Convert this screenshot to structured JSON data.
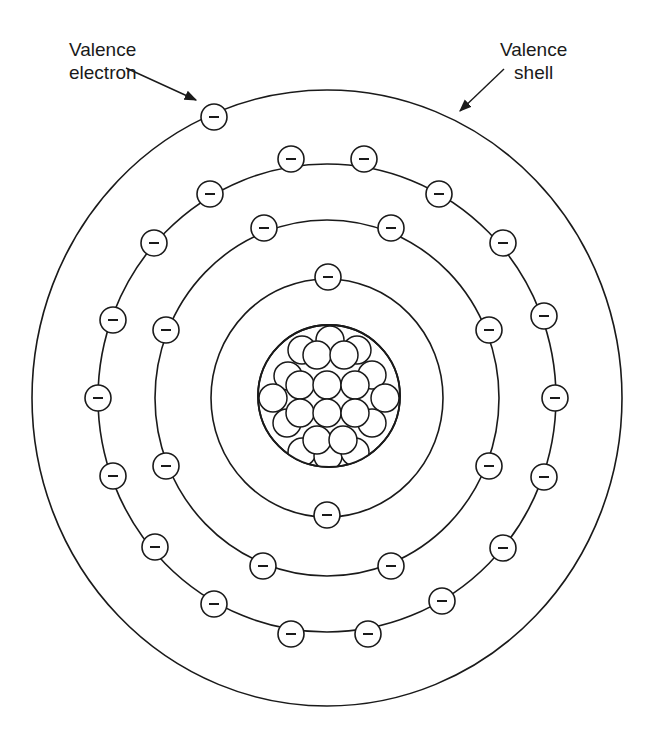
{
  "labels": {
    "valence_electron": [
      "Valence",
      "electron"
    ],
    "valence_shell": [
      "Valence",
      "shell"
    ]
  },
  "colors": {
    "stroke": "#1a1a1a",
    "background": "#ffffff"
  },
  "electron_symbol": "−",
  "center": [
    327,
    398
  ],
  "shells": [
    {
      "name": "shell-1",
      "rx": 116,
      "ry": 119,
      "electron_count": 2
    },
    {
      "name": "shell-2",
      "rx": 172,
      "ry": 178,
      "electron_count": 8
    },
    {
      "name": "shell-3",
      "rx": 229,
      "ry": 234,
      "electron_count": 18
    },
    {
      "name": "valence-shell",
      "rx": 295,
      "ry": 308,
      "electron_count": 1
    }
  ],
  "electrons": {
    "shell-1": [
      [
        328,
        277
      ],
      [
        327,
        515
      ]
    ],
    "shell-2": [
      [
        264,
        228
      ],
      [
        391,
        228
      ],
      [
        166,
        330
      ],
      [
        489,
        330
      ],
      [
        166,
        466
      ],
      [
        489,
        466
      ],
      [
        263,
        566
      ],
      [
        391,
        566
      ]
    ],
    "shell-3": [
      [
        291,
        159
      ],
      [
        364,
        159
      ],
      [
        210,
        194
      ],
      [
        439,
        194
      ],
      [
        154,
        243
      ],
      [
        503,
        243
      ],
      [
        113,
        320
      ],
      [
        544,
        316
      ],
      [
        98,
        398
      ],
      [
        555,
        398
      ],
      [
        113,
        476
      ],
      [
        544,
        477
      ],
      [
        155,
        547
      ],
      [
        503,
        548
      ],
      [
        214,
        604
      ],
      [
        442,
        601
      ],
      [
        291,
        634
      ],
      [
        368,
        634
      ]
    ],
    "valence-shell": [
      [
        214,
        117
      ]
    ]
  },
  "electron_radius": 13,
  "nucleus": {
    "center": [
      329,
      396
    ],
    "radius": 71,
    "particle_radius": 14,
    "particles": [
      [
        302,
        350
      ],
      [
        330,
        340
      ],
      [
        357,
        350
      ],
      [
        288,
        376
      ],
      [
        372,
        375
      ],
      [
        273,
        398
      ],
      [
        385,
        398
      ],
      [
        287,
        423
      ],
      [
        372,
        423
      ],
      [
        302,
        452
      ],
      [
        328,
        456
      ],
      [
        355,
        452
      ],
      [
        317,
        355
      ],
      [
        344,
        355
      ],
      [
        300,
        385
      ],
      [
        327,
        385
      ],
      [
        355,
        385
      ],
      [
        300,
        413
      ],
      [
        327,
        413
      ],
      [
        355,
        413
      ],
      [
        317,
        440
      ],
      [
        343,
        440
      ]
    ]
  },
  "arrows": {
    "valence_electron": {
      "from": [
        126,
        68
      ],
      "to": [
        196,
        100
      ]
    },
    "valence_shell": {
      "from": [
        504,
        69
      ],
      "to": [
        460,
        111
      ]
    }
  }
}
